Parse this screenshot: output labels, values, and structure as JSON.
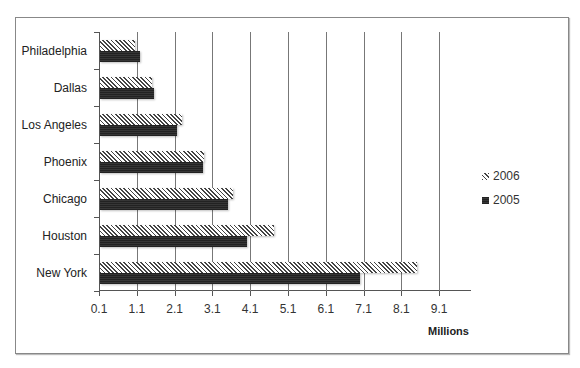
{
  "chart_data": {
    "type": "bar",
    "orientation": "horizontal",
    "title": "",
    "xlabel": "Millions",
    "ylabel": "",
    "categories": [
      "Philadelphia",
      "Dallas",
      "Los Angeles",
      "Phoenix",
      "Chicago",
      "Houston",
      "New York"
    ],
    "series": [
      {
        "name": "2006",
        "pattern": "diagonal-hatch",
        "values": [
          1.03,
          1.48,
          2.27,
          2.85,
          3.62,
          4.7,
          8.49
        ]
      },
      {
        "name": "2005",
        "pattern": "dark-dotted",
        "values": [
          1.16,
          1.53,
          2.14,
          2.82,
          3.49,
          3.99,
          6.98
        ]
      }
    ],
    "xticks": [
      "0.1",
      "1.1",
      "2.1",
      "3.1",
      "4.1",
      "5.1",
      "6.1",
      "7.1",
      "8.1",
      "9.1"
    ],
    "xlim": [
      0.1,
      9.9
    ],
    "grid": "vertical",
    "legend_position": "right"
  },
  "legend": [
    {
      "label": "2006"
    },
    {
      "label": "2005"
    }
  ],
  "unit_label": "Millions"
}
